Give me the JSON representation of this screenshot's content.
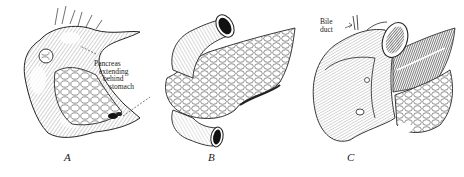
{
  "figure": {
    "panels": [
      {
        "id": "A",
        "label": "A",
        "annotation_lines": [
          "Pancreas",
          "extending",
          "behind",
          "stomach"
        ],
        "subject": "stomach with pancreas extending behind"
      },
      {
        "id": "B",
        "label": "B",
        "annotation_lines": [],
        "subject": "pancreas with duodenal tube ends"
      },
      {
        "id": "C",
        "label": "C",
        "annotation_lines": [
          "Bile",
          "duct"
        ],
        "subject": "opened duodenum with pancreas and bile duct"
      }
    ],
    "colors": {
      "ink": "#1a1a1a",
      "paper": "#ffffff",
      "shade": "#555555"
    }
  }
}
